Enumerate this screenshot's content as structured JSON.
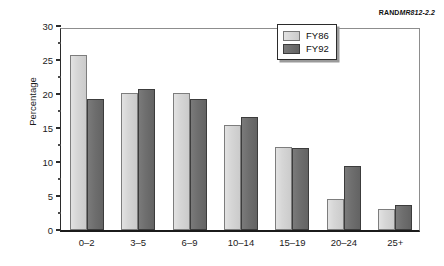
{
  "source_id": {
    "bold": "RAND",
    "italic": "MR812-2.2"
  },
  "chart_data": {
    "type": "bar",
    "title": "",
    "subtitle": "",
    "xlabel": "",
    "ylabel": "Percentage",
    "categories": [
      "0–2",
      "3–5",
      "6–9",
      "10–14",
      "15–19",
      "20–24",
      "25+"
    ],
    "series": [
      {
        "name": "FY86",
        "color": "#d3d3d3",
        "values": [
          25.8,
          20.1,
          20.1,
          15.4,
          12.2,
          4.6,
          3.1
        ]
      },
      {
        "name": "FY92",
        "color": "#6e6e6e",
        "values": [
          19.2,
          20.8,
          19.2,
          16.6,
          12.1,
          9.4,
          3.7
        ]
      }
    ],
    "ylim": [
      0,
      30
    ],
    "ytick_values": [
      0,
      5,
      10,
      15,
      20,
      25,
      30
    ],
    "ytick_labels": [
      "0",
      "5",
      "10",
      "15",
      "20",
      "25",
      "30"
    ],
    "yminor_values": [
      2.5,
      7.5,
      12.5,
      17.5,
      22.5,
      27.5
    ],
    "grid": false,
    "legend_position": "top-right"
  }
}
